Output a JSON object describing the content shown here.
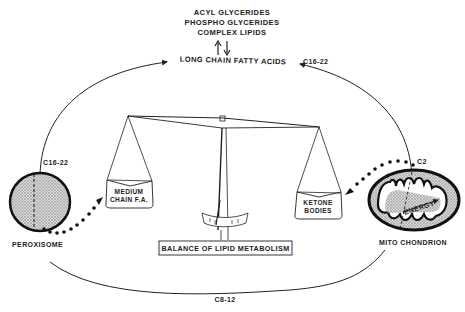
{
  "diagram": {
    "title": "BALANCE OF LIPID METABOLISM",
    "top_labels": [
      "ACYL GLYCERIDES",
      "PHOSPHO GLYCERIDES",
      "COMPLEX LIPIDS"
    ],
    "center_top": "LONG CHAIN FATTY ACIDS",
    "cycle_labels": {
      "left_upper": "C16-22",
      "right_upper": "C16-22",
      "right_c2": "C2",
      "bottom": "C8-12"
    },
    "organelles": {
      "left": "PEROXISOME",
      "right": "MITO CHONDRION",
      "right_inner": "ENERGY"
    },
    "scale_pans": {
      "left_line1": "MEDIUM",
      "left_line2": "CHAIN F.A.",
      "right_line1": "KETONE",
      "right_line2": "BODIES"
    },
    "colors": {
      "ink": "#222222",
      "stipple": "#9a9a9a",
      "background": "#ffffff"
    }
  }
}
